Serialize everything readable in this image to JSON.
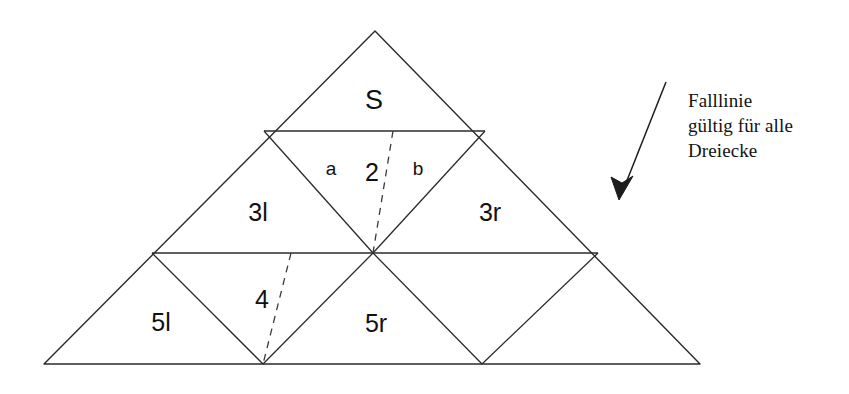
{
  "figure": {
    "background_color": "#ffffff",
    "stroke_color": "#2b2b2b",
    "dash_color": "#3a3a3a",
    "text_color": "#111111",
    "outer_triangle": {
      "apex": [
        375,
        31
      ],
      "left": [
        44,
        364
      ],
      "right": [
        700,
        364
      ]
    },
    "row_lines_y": [
      131,
      253,
      364
    ],
    "cell_labels": [
      {
        "id": "S",
        "text": "S",
        "x": 374,
        "y": 100,
        "size": "lbl-big"
      },
      {
        "id": "3l",
        "text": "3l",
        "x": 258,
        "y": 212,
        "size": "lbl-mid"
      },
      {
        "id": "2",
        "text": "2",
        "x": 372,
        "y": 172,
        "size": "lbl-mid"
      },
      {
        "id": "3r",
        "text": "3r",
        "x": 490,
        "y": 212,
        "size": "lbl-mid"
      },
      {
        "id": "5l",
        "text": "5l",
        "x": 161,
        "y": 322,
        "size": "lbl-mid"
      },
      {
        "id": "4",
        "text": "4",
        "x": 262,
        "y": 299,
        "size": "lbl-mid"
      },
      {
        "id": "5r",
        "text": "5r",
        "x": 376,
        "y": 323,
        "size": "lbl-mid"
      }
    ],
    "side_labels": [
      {
        "id": "a",
        "text": "a",
        "x": 331,
        "y": 168,
        "size": "lbl-small"
      },
      {
        "id": "b",
        "text": "b",
        "x": 418,
        "y": 168,
        "size": "lbl-small"
      }
    ],
    "fall_lines": [
      {
        "id": "falllinie-2",
        "from": [
          393,
          131
        ],
        "to": [
          373,
          253
        ]
      },
      {
        "id": "falllinie-4",
        "from": [
          291,
          253
        ],
        "to": [
          263,
          364
        ]
      }
    ],
    "arrow": {
      "from": [
        666,
        82
      ],
      "to": [
        619,
        200
      ]
    }
  },
  "annotation": {
    "lines": [
      "Falllinie",
      "gültig für alle",
      "Dreiecke"
    ],
    "text": "Falllinie\ngültig für alle\nDreiecke",
    "x": 688,
    "y": 88
  }
}
